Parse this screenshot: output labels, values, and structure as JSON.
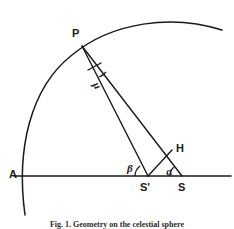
{
  "figure": {
    "caption": "Fig. 1. Geometry on the celestial sphere",
    "stroke_color": "#1a1a1a",
    "background_color": "#ffffff",
    "points": [
      {
        "id": "P",
        "label": "P",
        "x": 82,
        "y": 46,
        "label_x": 72,
        "label_y": 28
      },
      {
        "id": "A",
        "label": "A",
        "x": 22,
        "y": 176,
        "label_x": 10,
        "label_y": 170
      },
      {
        "id": "Sp",
        "label": "S'",
        "x": 148,
        "y": 176,
        "label_x": 140,
        "label_y": 182
      },
      {
        "id": "S",
        "label": "S",
        "x": 182,
        "y": 176,
        "label_x": 178,
        "label_y": 182
      },
      {
        "id": "H",
        "label": "H",
        "x": 172,
        "y": 150,
        "label_x": 176,
        "label_y": 144
      }
    ],
    "angles": [
      {
        "id": "mu",
        "label": "μ",
        "vertex": "P",
        "label_x": 94,
        "label_y": 80
      },
      {
        "id": "beta",
        "label": "β",
        "vertex": "S'",
        "label_x": 128,
        "label_y": 164
      },
      {
        "id": "alpha",
        "label": "α",
        "vertex": "S",
        "label_x": 166,
        "label_y": 167
      }
    ],
    "segments": [
      {
        "id": "baseline",
        "from": "A",
        "to": "S",
        "description": "horizontal-base-line"
      },
      {
        "id": "P-to-Sprime",
        "from": "P",
        "to": "S'",
        "description": "ray-P-to-S-prime"
      },
      {
        "id": "P-to-S",
        "from": "P",
        "to": "S",
        "description": "ray-P-to-S"
      },
      {
        "id": "Sprime-to-H",
        "from": "S'",
        "to": "H",
        "description": "segment-S-prime-to-H"
      }
    ],
    "arc": {
      "id": "great-circle-arc",
      "description": "circular-arc-through-A-and-P"
    },
    "right_angle_mark": {
      "id": "right-angle-at-H-foot",
      "description": "perpendicular-tick-near-P"
    }
  }
}
